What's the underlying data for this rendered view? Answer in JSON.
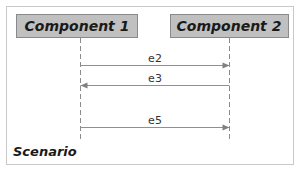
{
  "diagram": {
    "type": "sequence",
    "frame_label": "Scenario",
    "components": [
      {
        "id": "c1",
        "label": "Component 1"
      },
      {
        "id": "c2",
        "label": "Component 2"
      }
    ],
    "messages": [
      {
        "label": "e2",
        "from": "c1",
        "to": "c2"
      },
      {
        "label": "e3",
        "from": "c2",
        "to": "c1"
      },
      {
        "label": "e5",
        "from": "c1",
        "to": "c2"
      }
    ],
    "colors": {
      "component_fill": "#c0c0c0",
      "component_border": "#8a8a8a",
      "arrow": "#909090",
      "frame_border": "#c8c8c8"
    }
  }
}
